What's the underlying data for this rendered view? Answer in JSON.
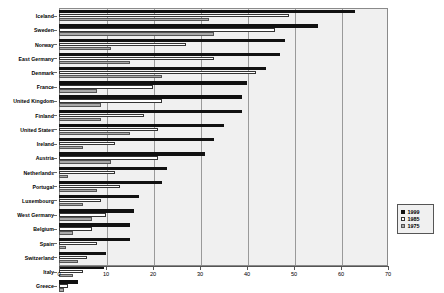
{
  "chart_data": {
    "type": "bar",
    "orientation": "horizontal",
    "title": "",
    "xlabel": "",
    "ylabel": "",
    "xlim": [
      0,
      70
    ],
    "xticks": [
      0,
      10,
      20,
      30,
      40,
      50,
      60,
      70
    ],
    "grid": true,
    "grid_axis": "x",
    "legend_position": "bottom-right",
    "categories": [
      "Iceland",
      "Sweden",
      "Norway",
      "East Germany",
      "Denmark",
      "France",
      "United Kingdom",
      "Finland",
      "United States",
      "Ireland",
      "Austria",
      "Netherlands",
      "Portugal",
      "Luxembourg",
      "West Germany",
      "Belgium",
      "Spain",
      "Switzerland",
      "Italy",
      "Greece"
    ],
    "series": [
      {
        "name": "1999",
        "color": "#111111",
        "values": [
          63,
          55,
          48,
          47,
          44,
          40,
          39,
          39,
          35,
          33,
          31,
          23,
          22,
          17,
          16,
          15,
          15,
          10,
          9.5,
          4
        ]
      },
      {
        "name": "1985",
        "color": "#ffffff",
        "values": [
          49,
          46,
          27,
          33,
          42,
          20,
          22,
          18,
          21,
          12,
          21,
          12,
          13,
          9,
          10,
          7,
          8,
          6,
          5,
          2
        ]
      },
      {
        "name": "1975",
        "color": "#a9a9a9",
        "values": [
          32,
          33,
          11,
          15,
          22,
          8,
          9,
          9,
          15,
          5,
          11,
          2,
          8,
          5,
          7,
          3,
          1.5,
          4,
          3,
          1
        ]
      }
    ]
  },
  "legend": {
    "entries": [
      {
        "label": "1999",
        "swatch": "y1999"
      },
      {
        "label": "1985",
        "swatch": "y1985"
      },
      {
        "label": "1975",
        "swatch": "y1975"
      }
    ]
  }
}
